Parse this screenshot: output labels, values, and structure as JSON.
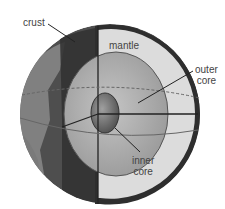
{
  "diagram": {
    "labels": {
      "crust": "crust",
      "mantle": "mantle",
      "outer_core_line1": "outer",
      "outer_core_line2": "core",
      "inner_core_line1": "inner",
      "inner_core_line2": "core"
    },
    "colors": {
      "crust": "#3a3a3a",
      "ocean": "#555555",
      "land": "#7a7a7a",
      "mantle": "#d9d9d9",
      "outer_core": "#a8a8a8",
      "inner_core": "#6a6a6a",
      "lines": "#222222"
    }
  }
}
